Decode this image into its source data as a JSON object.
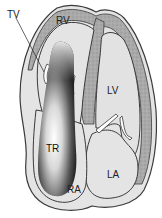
{
  "diagram": {
    "type": "cardiac-cross-section",
    "labels": {
      "tv": "TV",
      "rv": "RV",
      "lv": "LV",
      "tr": "TR",
      "ra": "RA",
      "la": "LA"
    },
    "colors": {
      "myocardium": "#a8a8a8",
      "chamber": "#e4e4e4",
      "outline": "#3a3a3a",
      "jet_dark": "#2a2a2a",
      "jet_light": "#ffffff"
    }
  }
}
